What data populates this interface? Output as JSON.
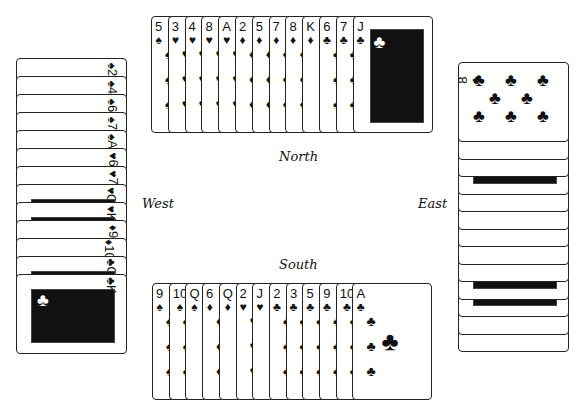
{
  "labels": {
    "north": "North",
    "south": "South",
    "east": "East",
    "west": "West"
  },
  "hands": {
    "north": [
      {
        "rank": "5",
        "suit": "♠"
      },
      {
        "rank": "3",
        "suit": "♥"
      },
      {
        "rank": "4",
        "suit": "♥"
      },
      {
        "rank": "8",
        "suit": "♥"
      },
      {
        "rank": "A",
        "suit": "♥"
      },
      {
        "rank": "2",
        "suit": "♦"
      },
      {
        "rank": "5",
        "suit": "♦"
      },
      {
        "rank": "7",
        "suit": "♦"
      },
      {
        "rank": "8",
        "suit": "♦"
      },
      {
        "rank": "K",
        "suit": "♦"
      },
      {
        "rank": "6",
        "suit": "♣"
      },
      {
        "rank": "7",
        "suit": "♣"
      },
      {
        "rank": "J",
        "suit": "♣"
      }
    ],
    "west": [
      {
        "rank": "2",
        "suit": "♠"
      },
      {
        "rank": "4",
        "suit": "♠"
      },
      {
        "rank": "6",
        "suit": "♠"
      },
      {
        "rank": "7",
        "suit": "♠"
      },
      {
        "rank": "A",
        "suit": "♠"
      },
      {
        "rank": "6",
        "suit": "♥"
      },
      {
        "rank": "7",
        "suit": "♥"
      },
      {
        "rank": "Q",
        "suit": "♥"
      },
      {
        "rank": "K",
        "suit": "♥"
      },
      {
        "rank": "9",
        "suit": "♦"
      },
      {
        "rank": "10",
        "suit": "♦"
      },
      {
        "rank": "Q",
        "suit": "♣"
      },
      {
        "rank": "K",
        "suit": "♣"
      }
    ],
    "east": [
      {
        "rank": "8",
        "suit": "♣"
      },
      {
        "rank": "4",
        "suit": "♣"
      },
      {
        "rank": "A",
        "suit": "♦"
      },
      {
        "rank": "J",
        "suit": "♦"
      },
      {
        "rank": "4",
        "suit": "♦"
      },
      {
        "rank": "3",
        "suit": "♦"
      },
      {
        "rank": "10",
        "suit": "♥"
      },
      {
        "rank": "9",
        "suit": "♥"
      },
      {
        "rank": "5",
        "suit": "♥"
      },
      {
        "rank": "K",
        "suit": "♠"
      },
      {
        "rank": "J",
        "suit": "♠"
      },
      {
        "rank": "8",
        "suit": "♠"
      },
      {
        "rank": "3",
        "suit": "♠"
      }
    ],
    "south": [
      {
        "rank": "9",
        "suit": "♠"
      },
      {
        "rank": "10",
        "suit": "♠"
      },
      {
        "rank": "Q",
        "suit": "♠"
      },
      {
        "rank": "6",
        "suit": "♦"
      },
      {
        "rank": "Q",
        "suit": "♦"
      },
      {
        "rank": "2",
        "suit": "♥"
      },
      {
        "rank": "J",
        "suit": "♥"
      },
      {
        "rank": "2",
        "suit": "♣"
      },
      {
        "rank": "3",
        "suit": "♣"
      },
      {
        "rank": "5",
        "suit": "♣"
      },
      {
        "rank": "9",
        "suit": "♣"
      },
      {
        "rank": "10",
        "suit": "♣"
      },
      {
        "rank": "A",
        "suit": "♣"
      }
    ]
  }
}
